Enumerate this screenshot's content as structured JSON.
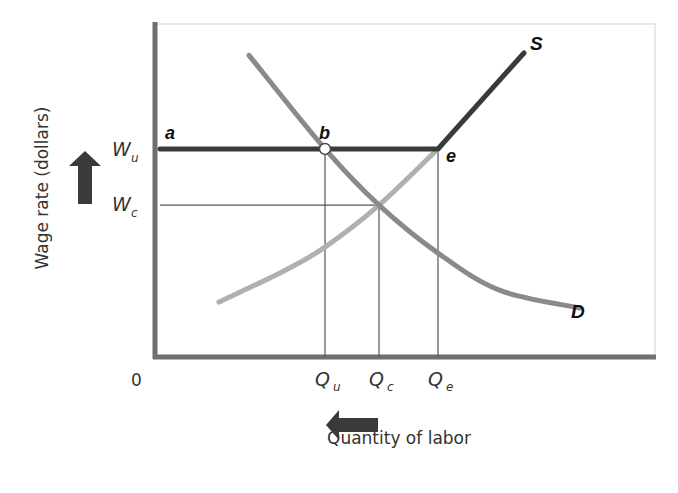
{
  "chart_data": {
    "type": "line",
    "title": "",
    "xlabel": "Quantity of labor",
    "ylabel": "Wage rate (dollars)",
    "origin_label": "0",
    "x_ticks": [
      {
        "id": "Qu",
        "main": "Q",
        "sub": "u",
        "value": 0.34
      },
      {
        "id": "Qc",
        "main": "Q",
        "sub": "c",
        "value": 0.448
      },
      {
        "id": "Qe",
        "main": "Q",
        "sub": "e",
        "value": 0.566
      }
    ],
    "y_ticks": [
      {
        "id": "Wu",
        "main": "W",
        "sub": "u",
        "value": 0.625
      },
      {
        "id": "Wc",
        "main": "W",
        "sub": "c",
        "value": 0.456
      }
    ],
    "xlim": [
      0,
      1
    ],
    "ylim": [
      0,
      1
    ],
    "series": [
      {
        "name": "D",
        "label": "D",
        "kind": "demand",
        "color": "#8a8a8a",
        "points": [
          [
            0.188,
            0.906
          ],
          [
            0.34,
            0.625
          ],
          [
            0.448,
            0.456
          ],
          [
            0.566,
            0.312
          ],
          [
            0.69,
            0.2
          ],
          [
            0.85,
            0.147
          ]
        ]
      },
      {
        "name": "S-lower",
        "label": "",
        "kind": "supply-original",
        "color": "#b0b0b0",
        "points": [
          [
            0.128,
            0.165
          ],
          [
            0.26,
            0.26
          ],
          [
            0.34,
            0.33
          ],
          [
            0.448,
            0.456
          ],
          [
            0.566,
            0.625
          ]
        ]
      },
      {
        "name": "S",
        "label": "S",
        "kind": "supply-union",
        "color": "#3a3a3a",
        "points": [
          [
            0.01,
            0.625
          ],
          [
            0.566,
            0.625
          ],
          [
            0.738,
            0.913
          ]
        ]
      }
    ],
    "guides": [
      {
        "from": [
          0.34,
          0.625
        ],
        "to": [
          0.34,
          0
        ]
      },
      {
        "from": [
          0.448,
          0.456
        ],
        "to": [
          0.448,
          0
        ]
      },
      {
        "from": [
          0.566,
          0.625
        ],
        "to": [
          0.566,
          0
        ]
      },
      {
        "from": [
          0.01,
          0.456
        ],
        "to": [
          0.448,
          0.456
        ]
      }
    ],
    "annotations": [
      {
        "text": "a",
        "at": [
          0.01,
          0.625
        ]
      },
      {
        "text": "b",
        "at": [
          0.34,
          0.625
        ],
        "marker": "open-circle"
      },
      {
        "text": "e",
        "at": [
          0.566,
          0.625
        ]
      }
    ],
    "arrows": [
      {
        "name": "wage-increase-arrow",
        "direction": "up",
        "axis": "y"
      },
      {
        "name": "quantity-decrease-arrow",
        "direction": "left",
        "axis": "x"
      }
    ],
    "grid": false,
    "legend": "none"
  }
}
